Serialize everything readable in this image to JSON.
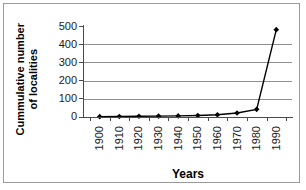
{
  "chart_data": {
    "type": "line",
    "title": "",
    "xlabel": "Years",
    "ylabel": "Cummulative number of localities",
    "x": [
      1900,
      1910,
      1920,
      1930,
      1940,
      1950,
      1960,
      1970,
      1980,
      1990
    ],
    "categories": [
      "1900",
      "1910",
      "1920",
      "1930",
      "1940",
      "1950",
      "1960",
      "1970",
      "1980",
      "1990"
    ],
    "values": [
      2,
      3,
      4,
      5,
      6,
      8,
      12,
      22,
      42,
      480
    ],
    "series": [
      {
        "name": "Cummulative number of localities",
        "values": [
          2,
          3,
          4,
          5,
          6,
          8,
          12,
          22,
          42,
          480
        ]
      }
    ],
    "ylim": [
      0,
      500
    ],
    "yticks": [
      0,
      100,
      200,
      300,
      400,
      500
    ],
    "ytick_labels": [
      "0",
      "100",
      "200",
      "300",
      "400",
      "500"
    ],
    "grid": true,
    "grid_axis": "y",
    "legend": false,
    "marker": "diamond",
    "line_color": "#000000",
    "marker_color": "#000000",
    "grid_color": "#8f8f8f",
    "axis_color": "#4a4a4a",
    "background_color": "#ffffff",
    "border_color": "#9a9a9a"
  },
  "axes": {
    "y_title": "Cummulative number\nof localities",
    "x_title": "Years"
  }
}
